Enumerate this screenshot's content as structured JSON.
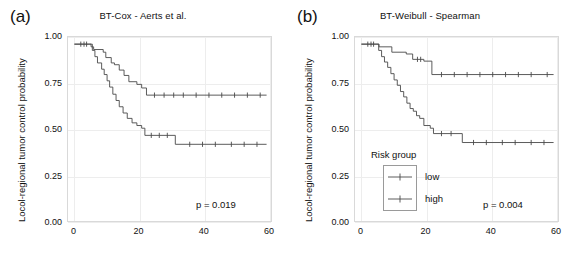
{
  "figure": {
    "width": 573,
    "height": 266,
    "background": "#ffffff",
    "line_color": "#4a4a4a",
    "grid_color": "#ededed",
    "frame_color": "#d9d9d9"
  },
  "panels": [
    {
      "letter": "(a)",
      "title": "BT-Cox - Aerts et al.",
      "pvalue_label": "p = 0.019",
      "legend_visible": false
    },
    {
      "letter": "(b)",
      "title": "BT-Weibull - Spearman",
      "pvalue_label": "p = 0.004",
      "legend_visible": true,
      "legend": {
        "title": "Risk group",
        "items": [
          {
            "label": "low"
          },
          {
            "label": "high"
          }
        ]
      }
    }
  ],
  "axes": {
    "ylabel": "Locol-regional tumor control probability",
    "xlabel": "",
    "yticks": [
      "1.00",
      "0.75",
      "0.50",
      "0.25",
      "0.00"
    ],
    "ytick_values": [
      1.0,
      0.75,
      0.5,
      0.25,
      0.0
    ],
    "xticks": [
      "0",
      "20",
      "40",
      "60"
    ],
    "xtick_values": [
      0,
      20,
      40,
      60
    ],
    "xlim": [
      -2,
      62
    ],
    "ylim": [
      0,
      1.04
    ],
    "grid": true
  },
  "chart_data": [
    {
      "type": "line",
      "plot_kind": "kaplan-meier-step",
      "panel": "(a)",
      "title": "BT-Cox - Aerts et al.",
      "xlabel": "",
      "ylabel": "Locol-regional tumor control probability",
      "xlim": [
        -2,
        62
      ],
      "ylim": [
        0,
        1.04
      ],
      "grid": true,
      "annotations": [
        "p = 0.019"
      ],
      "series": [
        {
          "name": "low",
          "x": [
            0,
            4.5,
            5.2,
            6.0,
            9.0,
            9.8,
            11.5,
            12.5,
            14.0,
            15.5,
            17.0,
            19.5,
            21.0,
            22.5,
            60
          ],
          "y": [
            1.0,
            1.0,
            0.985,
            0.97,
            0.955,
            0.925,
            0.895,
            0.885,
            0.855,
            0.825,
            0.79,
            0.775,
            0.755,
            0.715,
            0.715
          ],
          "censor_x": [
            2.0,
            3.0,
            3.8,
            25.0,
            28.0,
            31.0,
            34.0,
            38.0,
            42.0,
            46.0,
            50.0,
            54.0,
            58.0
          ],
          "censor_y": [
            1.0,
            1.0,
            1.0,
            0.715,
            0.715,
            0.715,
            0.715,
            0.715,
            0.715,
            0.715,
            0.715,
            0.715,
            0.715
          ],
          "final_value": 0.715
        },
        {
          "name": "high",
          "x": [
            0,
            4.8,
            5.6,
            6.4,
            7.2,
            8.5,
            9.3,
            10.2,
            11.0,
            12.0,
            13.0,
            14.0,
            15.2,
            16.5,
            18.0,
            19.5,
            21.0,
            22.0,
            31.5,
            60
          ],
          "y": [
            1.0,
            1.0,
            0.965,
            0.93,
            0.895,
            0.86,
            0.83,
            0.795,
            0.76,
            0.72,
            0.685,
            0.65,
            0.615,
            0.585,
            0.56,
            0.545,
            0.53,
            0.49,
            0.44,
            0.44
          ],
          "censor_x": [
            24.0,
            26.5,
            29.0,
            36.0,
            40.0,
            44.0,
            49.0,
            53.0,
            57.0
          ],
          "censor_y": [
            0.49,
            0.49,
            0.49,
            0.44,
            0.44,
            0.44,
            0.44,
            0.44,
            0.44
          ],
          "final_value": 0.44
        }
      ]
    },
    {
      "type": "line",
      "plot_kind": "kaplan-meier-step",
      "panel": "(b)",
      "title": "BT-Weibull - Spearman",
      "xlabel": "",
      "ylabel": "Locol-regional tumor control probability",
      "xlim": [
        -2,
        62
      ],
      "ylim": [
        0,
        1.04
      ],
      "grid": true,
      "annotations": [
        "p = 0.004"
      ],
      "series": [
        {
          "name": "low",
          "x": [
            0,
            4.5,
            5.5,
            9.5,
            14.0,
            16.0,
            19.5,
            22.0,
            60
          ],
          "y": [
            1.0,
            1.0,
            0.985,
            0.955,
            0.945,
            0.915,
            0.905,
            0.83,
            0.83
          ],
          "censor_x": [
            2.0,
            3.0,
            3.8,
            17.5,
            18.5,
            25.0,
            29.0,
            33.0,
            37.0,
            41.0,
            45.0,
            49.0,
            53.0,
            58.0
          ],
          "censor_y": [
            1.0,
            1.0,
            1.0,
            0.915,
            0.915,
            0.83,
            0.83,
            0.83,
            0.83,
            0.83,
            0.83,
            0.83,
            0.83,
            0.83
          ],
          "final_value": 0.83
        },
        {
          "name": "high",
          "x": [
            0,
            4.6,
            5.4,
            6.3,
            7.2,
            8.2,
            9.2,
            10.2,
            11.2,
            12.2,
            13.2,
            14.2,
            15.2,
            16.2,
            17.2,
            18.2,
            19.5,
            21.5,
            22.5,
            31.5,
            60
          ],
          "y": [
            1.0,
            1.0,
            0.965,
            0.93,
            0.9,
            0.87,
            0.835,
            0.8,
            0.77,
            0.735,
            0.705,
            0.67,
            0.64,
            0.625,
            0.6,
            0.585,
            0.545,
            0.53,
            0.5,
            0.45,
            0.45
          ],
          "censor_x": [
            25.0,
            28.0,
            35.0,
            39.0,
            44.0,
            48.0,
            53.0,
            57.0
          ],
          "censor_y": [
            0.5,
            0.5,
            0.45,
            0.45,
            0.45,
            0.45,
            0.45,
            0.45
          ],
          "final_value": 0.45
        }
      ]
    }
  ]
}
